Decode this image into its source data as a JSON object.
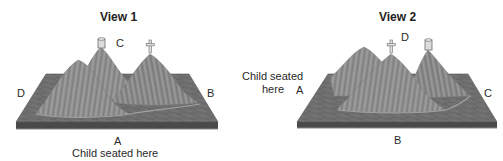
{
  "figure": {
    "colors": {
      "board_top": "#6f6f6f",
      "board_edge": "#4a4a4a",
      "mountain": "#8c8c8c",
      "mountain_light": "#a6a6a6",
      "mountain_dark": "#777777",
      "landmark_fill": "#dcdcdc",
      "landmark_stroke": "#6a6a6a"
    }
  },
  "views": [
    {
      "title": "View 1",
      "labels": {
        "front": "A",
        "right": "B",
        "back": "C",
        "left": "D"
      },
      "observer_caption": "Child seated here",
      "observer_position": "A",
      "landmarks": [
        {
          "name": "tower",
          "position": "back-center mountain, near C"
        },
        {
          "name": "cross",
          "position": "right mountain"
        }
      ]
    },
    {
      "title": "View 2",
      "labels": {
        "left": "A",
        "front": "B",
        "right": "C",
        "back": "D"
      },
      "observer_caption_line1": "Child seated",
      "observer_caption_line2": "here",
      "observer_position": "A",
      "landmarks": [
        {
          "name": "cross",
          "position": "center mountain, near D"
        },
        {
          "name": "tower",
          "position": "right mountain"
        }
      ]
    }
  ]
}
